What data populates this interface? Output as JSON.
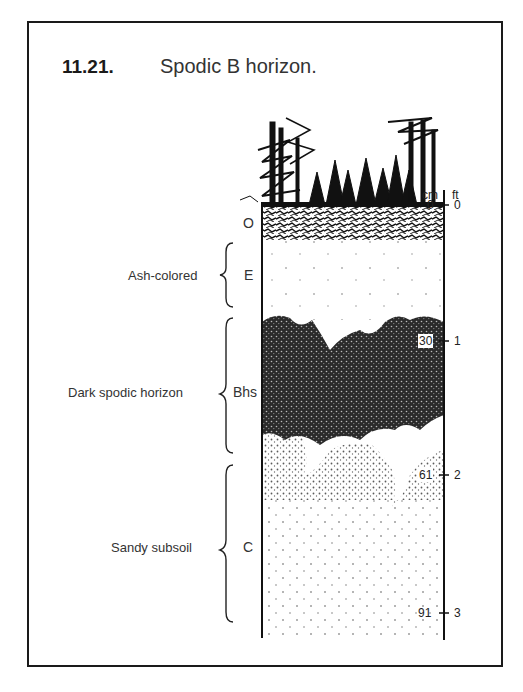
{
  "figure": {
    "number": "11.21.",
    "title": "Spodic B horizon."
  },
  "scale": {
    "left_unit": "cm",
    "right_unit": "ft",
    "ticks": [
      {
        "cm": "0",
        "ft": "0"
      },
      {
        "cm": "30",
        "ft": "1"
      },
      {
        "cm": "61",
        "ft": "2"
      },
      {
        "cm": "91",
        "ft": "3"
      }
    ]
  },
  "horizons": [
    {
      "symbol": "O",
      "description": ""
    },
    {
      "symbol": "E",
      "description": "Ash-colored"
    },
    {
      "symbol": "Bhs",
      "description": "Dark spodic horizon"
    },
    {
      "symbol": "C",
      "description": "Sandy subsoil"
    }
  ],
  "colors": {
    "ink": "#1a1a1a",
    "background": "#ffffff",
    "text": "#333333"
  }
}
